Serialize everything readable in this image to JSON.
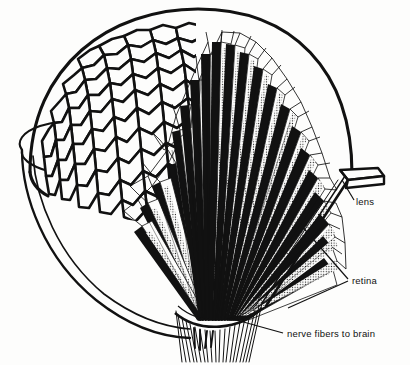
{
  "figure": {
    "style": "black and white line drawing",
    "background_color": "#fdfdfc",
    "ink_color": "#111111"
  },
  "labels": [
    {
      "id": "lens",
      "text": "lens",
      "x": 356,
      "y": 205,
      "anchor": "start",
      "leader": [
        [
          354,
          200
        ],
        [
          342,
          180
        ]
      ]
    },
    {
      "id": "retina",
      "text": "retina",
      "x": 352,
      "y": 284,
      "anchor": "start",
      "leader": [
        [
          348,
          279
        ],
        [
          300,
          224
        ]
      ]
    },
    {
      "id": "nerve-fibers",
      "text": "nerve fibers to brain",
      "x": 287,
      "y": 337,
      "anchor": "start",
      "leader": [
        [
          283,
          333
        ],
        [
          229,
          318
        ]
      ]
    }
  ],
  "structures": {
    "dome": "hexagonal faceted corneal surface",
    "ommatidia": "radiating wedge-shaped visual units",
    "rhabdom": "stippled central light-sensing rod",
    "nerve_bundle": "converging fiber bundle at base",
    "socket": "cut-away eye cup / head capsule",
    "lens_tab": "protruding single facet at right"
  },
  "counts": {
    "ommatidia_visible": 21,
    "nerve_fibers": 30,
    "facet_rows": 9
  }
}
